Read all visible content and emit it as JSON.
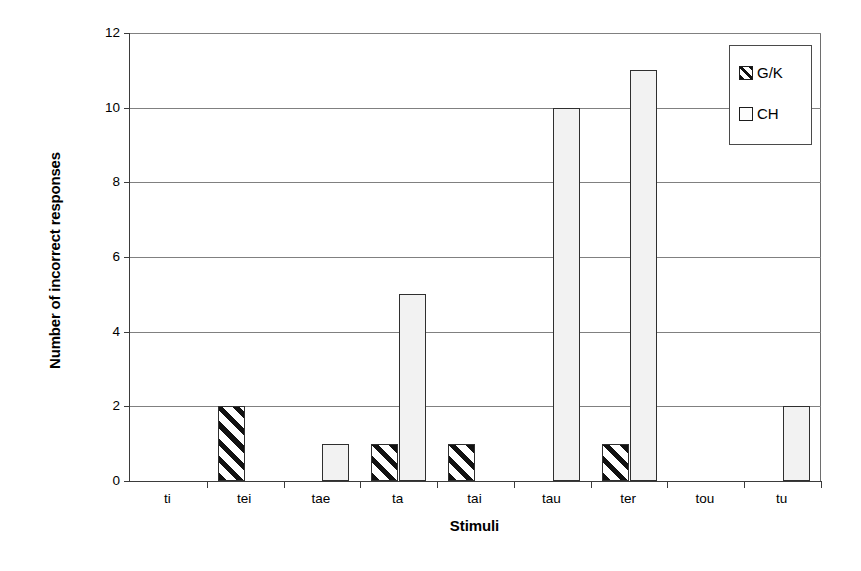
{
  "chart_data": {
    "type": "bar",
    "title": "",
    "xlabel": "Stimuli",
    "ylabel": "Number of incorrect responses",
    "categories": [
      "ti",
      "tei",
      "tae",
      "ta",
      "tai",
      "tau",
      "ter",
      "tou",
      "tu"
    ],
    "series": [
      {
        "name": "G/K",
        "values": [
          0,
          2,
          0,
          1,
          1,
          0,
          1,
          0,
          0
        ]
      },
      {
        "name": "CH",
        "values": [
          0,
          0,
          1,
          5,
          0,
          10,
          11,
          0,
          2
        ]
      }
    ],
    "ylim": [
      0,
      12
    ],
    "yticks": [
      0,
      2,
      4,
      6,
      8,
      10,
      12
    ],
    "ytick_labels": [
      "0",
      "2",
      "4",
      "6",
      "8",
      "10",
      "12"
    ],
    "grid": true,
    "legend_position": "top-right",
    "colors": {
      "gk_fill": "#ffffff",
      "gk_hatch": "#111111",
      "ch_fill": "#f2f2f2",
      "bar_edge": "#2f2f2f",
      "gridline": "#808080",
      "axis": "#3b3b3b"
    }
  },
  "legend": {
    "items": [
      {
        "label": "G/K",
        "swatch": "hatched-swatch-icon"
      },
      {
        "label": "CH",
        "swatch": "plain-swatch-icon"
      }
    ]
  }
}
